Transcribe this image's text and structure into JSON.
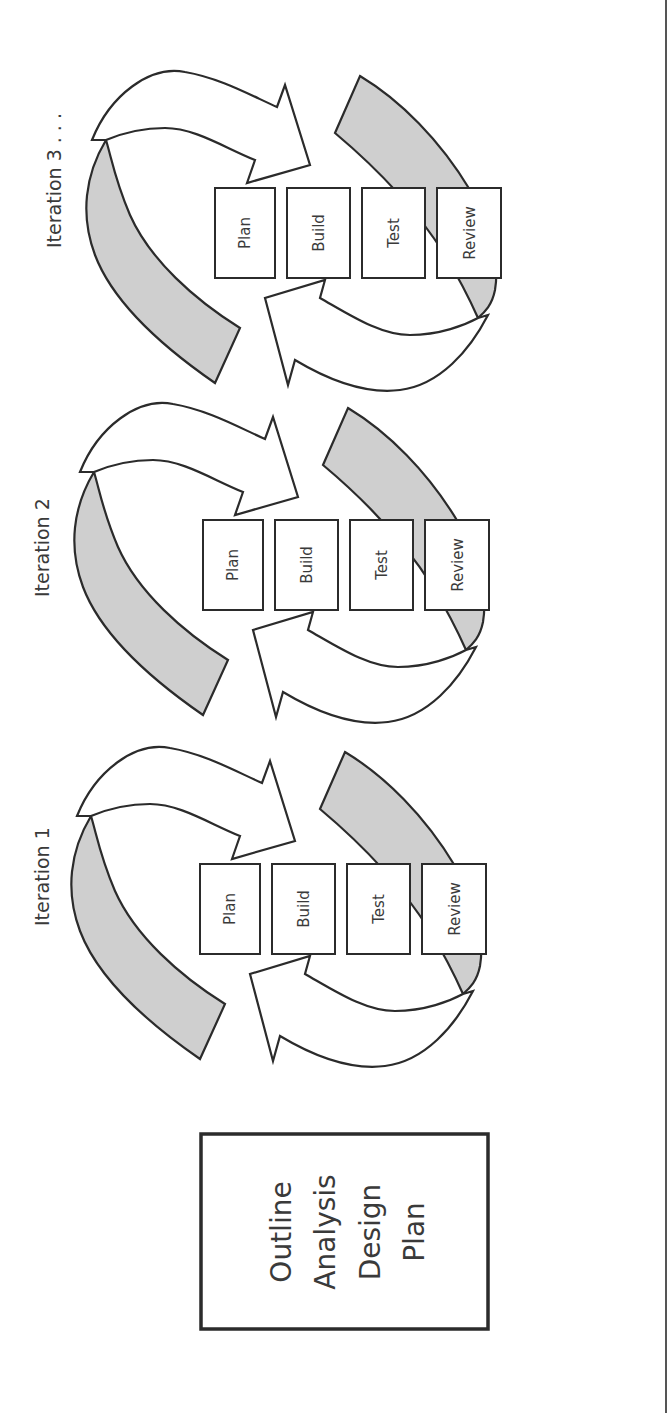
{
  "diagram": {
    "type": "iterative development process",
    "orientation": "rotated 90deg counter-clockwise",
    "colors": {
      "stroke": "#2b2b2b",
      "band_fill": "#cfcfcf",
      "arrow_fill": "#ffffff",
      "text": "#3a3a3a",
      "background": "#ffffff"
    },
    "initial_box": {
      "lines": [
        "Outline",
        "Analysis",
        "Design",
        "Plan"
      ]
    },
    "iterations": [
      {
        "title": "Iteration 1",
        "steps": [
          "Plan",
          "Build",
          "Test",
          "Review"
        ]
      },
      {
        "title": "Iteration 2",
        "steps": [
          "Plan",
          "Build",
          "Test",
          "Review"
        ]
      },
      {
        "title": "Iteration 3 . . .",
        "steps": [
          "Plan",
          "Build",
          "Test",
          "Review"
        ]
      }
    ]
  }
}
